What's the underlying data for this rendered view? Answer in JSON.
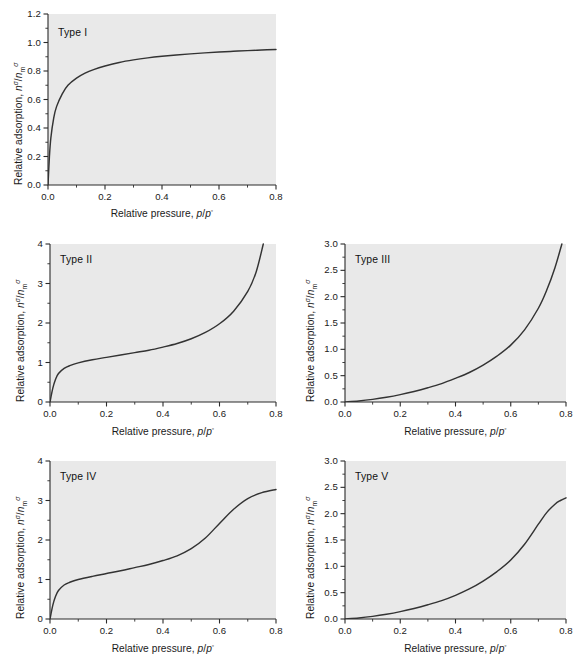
{
  "figure": {
    "axis_titles": {
      "x": "Relative pressure, p/p°",
      "y": "Relative adsorption, nσ/nσm"
    }
  },
  "panels": [
    {
      "label": "Type I",
      "xlabel": "Relative pressure, p/p°",
      "ylabel": "Relative adsorption, nσ/nσm",
      "xticks": [
        "0.0",
        "0.2",
        "0.4",
        "0.6",
        "0.8"
      ],
      "yticks": [
        "0.0",
        "0.2",
        "0.4",
        "0.6",
        "0.8",
        "1.0",
        "1.2"
      ]
    },
    {
      "label": "Type II",
      "xlabel": "Relative pressure, p/p°",
      "ylabel": "Relative adsorption, nσ/nσm",
      "xticks": [
        "0.0",
        "0.2",
        "0.4",
        "0.6",
        "0.8"
      ],
      "yticks": [
        "0",
        "1",
        "2",
        "3",
        "4"
      ]
    },
    {
      "label": "Type III",
      "xlabel": "Relative pressure, p/p°",
      "ylabel": "Relative adsorption, nσ/nσm",
      "xticks": [
        "0.0",
        "0.2",
        "0.4",
        "0.6",
        "0.8"
      ],
      "yticks": [
        "0.0",
        "0.5",
        "1.0",
        "1.5",
        "2.0",
        "2.5",
        "3.0"
      ]
    },
    {
      "label": "Type IV",
      "xlabel": "Relative pressure, p/p°",
      "ylabel": "Relative adsorption, nσ/nσm",
      "xticks": [
        "0.0",
        "0.2",
        "0.4",
        "0.6",
        "0.8"
      ],
      "yticks": [
        "0",
        "1",
        "2",
        "3",
        "4"
      ]
    },
    {
      "label": "Type V",
      "xlabel": "Relative pressure, p/p°",
      "ylabel": "Relative adsorption, nσ/nσm",
      "xticks": [
        "0.0",
        "0.2",
        "0.4",
        "0.6",
        "0.8"
      ],
      "yticks": [
        "0.0",
        "0.5",
        "1.0",
        "1.5",
        "2.0",
        "2.5",
        "3.0"
      ]
    }
  ],
  "chart_data": [
    {
      "type": "line",
      "title": "Type I",
      "xlabel": "Relative pressure, p/p°",
      "ylabel": "Relative adsorption, nσ/nσm",
      "xlim": [
        0.0,
        0.8
      ],
      "ylim": [
        0.0,
        1.2
      ],
      "xticks": [
        0.0,
        0.2,
        0.4,
        0.6,
        0.8
      ],
      "yticks": [
        0.0,
        0.2,
        0.4,
        0.6,
        0.8,
        1.0,
        1.2
      ],
      "grid": false,
      "legend": "none",
      "x": [
        0.0,
        0.005,
        0.01,
        0.02,
        0.03,
        0.05,
        0.07,
        0.1,
        0.13,
        0.16,
        0.2,
        0.25,
        0.3,
        0.35,
        0.4,
        0.45,
        0.5,
        0.55,
        0.6,
        0.65,
        0.7,
        0.75,
        0.8
      ],
      "y": [
        0.0,
        0.2,
        0.33,
        0.47,
        0.55,
        0.64,
        0.7,
        0.75,
        0.785,
        0.81,
        0.835,
        0.86,
        0.878,
        0.892,
        0.903,
        0.912,
        0.92,
        0.927,
        0.933,
        0.938,
        0.943,
        0.947,
        0.951
      ]
    },
    {
      "type": "line",
      "title": "Type II",
      "xlabel": "Relative pressure, p/p°",
      "ylabel": "Relative adsorption, nσ/nσm",
      "xlim": [
        0.0,
        0.8
      ],
      "ylim": [
        0.0,
        4.0
      ],
      "xticks": [
        0.0,
        0.2,
        0.4,
        0.6,
        0.8
      ],
      "yticks": [
        0,
        1,
        2,
        3,
        4
      ],
      "grid": false,
      "legend": "none",
      "x": [
        0.0,
        0.01,
        0.02,
        0.03,
        0.05,
        0.07,
        0.1,
        0.15,
        0.2,
        0.25,
        0.3,
        0.35,
        0.4,
        0.45,
        0.5,
        0.55,
        0.6,
        0.65,
        0.7,
        0.73,
        0.755
      ],
      "y": [
        0.0,
        0.35,
        0.58,
        0.72,
        0.85,
        0.92,
        0.99,
        1.07,
        1.13,
        1.19,
        1.25,
        1.31,
        1.39,
        1.48,
        1.6,
        1.76,
        1.98,
        2.3,
        2.8,
        3.3,
        4.0
      ]
    },
    {
      "type": "line",
      "title": "Type III",
      "xlabel": "Relative pressure, p/p°",
      "ylabel": "Relative adsorption, nσ/nσm",
      "xlim": [
        0.0,
        0.8
      ],
      "ylim": [
        0.0,
        3.0
      ],
      "xticks": [
        0.0,
        0.2,
        0.4,
        0.6,
        0.8
      ],
      "yticks": [
        0.0,
        0.5,
        1.0,
        1.5,
        2.0,
        2.5,
        3.0
      ],
      "grid": false,
      "legend": "none",
      "x": [
        0.0,
        0.05,
        0.1,
        0.15,
        0.2,
        0.25,
        0.3,
        0.35,
        0.4,
        0.45,
        0.5,
        0.55,
        0.6,
        0.65,
        0.7,
        0.73,
        0.76,
        0.785
      ],
      "y": [
        0.0,
        0.02,
        0.05,
        0.09,
        0.14,
        0.2,
        0.27,
        0.35,
        0.45,
        0.56,
        0.7,
        0.87,
        1.08,
        1.37,
        1.78,
        2.12,
        2.55,
        3.0
      ]
    },
    {
      "type": "line",
      "title": "Type IV",
      "xlabel": "Relative pressure, p/p°",
      "ylabel": "Relative adsorption, nσ/nσm",
      "xlim": [
        0.0,
        0.8
      ],
      "ylim": [
        0.0,
        4.0
      ],
      "xticks": [
        0.0,
        0.2,
        0.4,
        0.6,
        0.8
      ],
      "yticks": [
        0,
        1,
        2,
        3,
        4
      ],
      "grid": false,
      "legend": "none",
      "x": [
        0.0,
        0.01,
        0.02,
        0.03,
        0.05,
        0.07,
        0.1,
        0.15,
        0.2,
        0.25,
        0.3,
        0.35,
        0.4,
        0.45,
        0.5,
        0.55,
        0.6,
        0.65,
        0.7,
        0.75,
        0.8
      ],
      "y": [
        0.0,
        0.35,
        0.58,
        0.72,
        0.86,
        0.93,
        1.0,
        1.08,
        1.15,
        1.22,
        1.3,
        1.38,
        1.48,
        1.6,
        1.78,
        2.05,
        2.42,
        2.78,
        3.05,
        3.2,
        3.28
      ]
    },
    {
      "type": "line",
      "title": "Type V",
      "xlabel": "Relative pressure, p/p°",
      "ylabel": "Relative adsorption, nσ/nσm",
      "xlim": [
        0.0,
        0.8
      ],
      "ylim": [
        0.0,
        3.0
      ],
      "xticks": [
        0.0,
        0.2,
        0.4,
        0.6,
        0.8
      ],
      "yticks": [
        0.0,
        0.5,
        1.0,
        1.5,
        2.0,
        2.5,
        3.0
      ],
      "grid": false,
      "legend": "none",
      "x": [
        0.0,
        0.05,
        0.1,
        0.15,
        0.2,
        0.25,
        0.3,
        0.35,
        0.4,
        0.45,
        0.5,
        0.55,
        0.6,
        0.65,
        0.7,
        0.73,
        0.76,
        0.78,
        0.8
      ],
      "y": [
        0.0,
        0.02,
        0.05,
        0.09,
        0.14,
        0.2,
        0.27,
        0.35,
        0.45,
        0.57,
        0.72,
        0.9,
        1.12,
        1.42,
        1.8,
        2.02,
        2.18,
        2.25,
        2.3
      ]
    }
  ]
}
